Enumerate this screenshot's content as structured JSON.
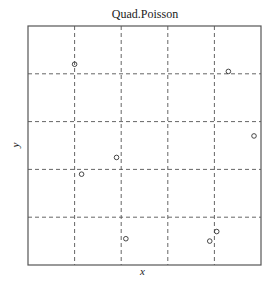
{
  "chart_data": {
    "type": "scatter",
    "title": "Quad.Poisson",
    "xlabel": "x",
    "ylabel": "y",
    "xlim": [
      0,
      1
    ],
    "ylim": [
      0,
      1
    ],
    "grid": {
      "on": true,
      "style": "dashed",
      "x_lines": [
        0.2,
        0.4,
        0.6,
        0.8
      ],
      "y_lines": [
        0.2,
        0.4,
        0.6,
        0.8
      ]
    },
    "marker": "open-circle",
    "series": [
      {
        "name": "points",
        "x": [
          0.2,
          0.86,
          0.97,
          0.38,
          0.23,
          0.42,
          0.81,
          0.78
        ],
        "y": [
          0.84,
          0.81,
          0.54,
          0.45,
          0.38,
          0.11,
          0.14,
          0.1
        ]
      }
    ],
    "legend": null
  },
  "colors": {
    "frame": "#555555",
    "grid": "#555555",
    "points": "#333333"
  }
}
